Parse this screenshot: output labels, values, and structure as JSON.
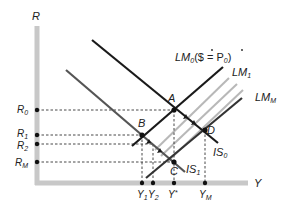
{
  "axes": {
    "y_label": "R",
    "x_label": "Y",
    "axis_color": "#c8c8c8"
  },
  "curves": {
    "lm0": {
      "label": "LM",
      "sub": "0",
      "suffix": "($ = P",
      "suffix_sub": "0",
      "suffix_end": ")"
    },
    "lm1": {
      "label": "LM",
      "sub": "1"
    },
    "lmm": {
      "label": "LM",
      "sub": "M"
    },
    "is0": {
      "label": "IS",
      "sub": "0"
    },
    "is1": {
      "label": "IS",
      "sub": "1"
    }
  },
  "points": {
    "a": "A",
    "b": "B",
    "c": "C",
    "d": "D"
  },
  "r_ticks": [
    {
      "label": "R",
      "sub": "0"
    },
    {
      "label": "R",
      "sub": "1"
    },
    {
      "label": "R",
      "sub": "2"
    },
    {
      "label": "R",
      "sub": "M"
    }
  ],
  "y_ticks": [
    {
      "label": "Y",
      "sub": "1"
    },
    {
      "label": "Y",
      "sub": "2"
    },
    {
      "label": "Y",
      "sub": "*"
    },
    {
      "label": "Y",
      "sub": "M"
    }
  ],
  "colors": {
    "dark_line": "#1a1a1a",
    "mid_line": "#555555",
    "light_line": "#b5b5b5",
    "dashed": "#333333"
  }
}
